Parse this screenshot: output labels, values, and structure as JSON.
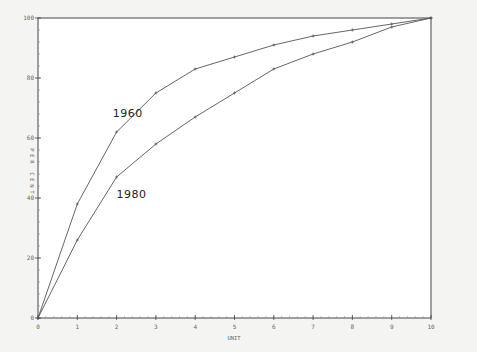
{
  "chart_data": {
    "type": "line",
    "title": "",
    "xlabel": "UNIT",
    "ylabel": "PER CENT",
    "xlim": [
      0,
      10
    ],
    "ylim": [
      0,
      100
    ],
    "grid": false,
    "legend": "inline labels",
    "x": [
      0,
      1,
      2,
      3,
      4,
      5,
      6,
      7,
      8,
      9,
      10
    ],
    "x_tick_labels": [
      "0",
      "1",
      "2",
      "3",
      "4",
      "5",
      "6",
      "7",
      "8",
      "9",
      "10"
    ],
    "y_tick_labels": [
      "0",
      "20",
      "40",
      "60",
      "80",
      "100"
    ],
    "y_ticks": [
      0,
      20,
      40,
      60,
      80,
      100
    ],
    "series": [
      {
        "name": "1960",
        "values": [
          0,
          38,
          62,
          75,
          83,
          87,
          91,
          94,
          96,
          98,
          100
        ],
        "label_pos": {
          "x": 1.9,
          "y": 67
        }
      },
      {
        "name": "1980",
        "values": [
          0,
          26,
          47,
          58,
          67,
          75,
          83,
          88,
          92,
          97,
          100
        ],
        "label_pos": {
          "x": 2.0,
          "y": 40
        }
      }
    ],
    "colors": {
      "line": "#555555",
      "axis": "#444444",
      "background": "#ffffff"
    }
  }
}
